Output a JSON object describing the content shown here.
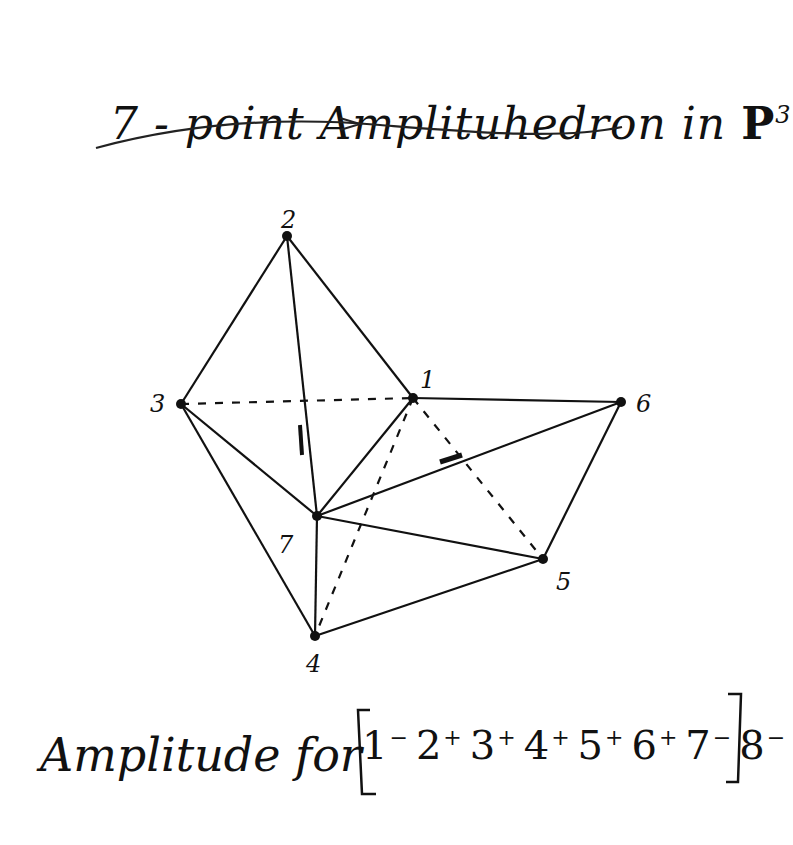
{
  "title": {
    "prefix": "7 - point Amplituhedron in ",
    "space": "P",
    "exponent": "3"
  },
  "diagram": {
    "vertices": [
      {
        "id": "1",
        "label": "1",
        "x": 413,
        "y": 398,
        "lx": 420,
        "ly": 388
      },
      {
        "id": "2",
        "label": "2",
        "x": 287,
        "y": 236,
        "lx": 281,
        "ly": 228
      },
      {
        "id": "3",
        "label": "3",
        "x": 181,
        "y": 404,
        "lx": 150,
        "ly": 412
      },
      {
        "id": "4",
        "label": "4",
        "x": 315,
        "y": 636,
        "lx": 306,
        "ly": 672
      },
      {
        "id": "5",
        "label": "5",
        "x": 543,
        "y": 559,
        "lx": 556,
        "ly": 590
      },
      {
        "id": "6",
        "label": "6",
        "x": 621,
        "y": 402,
        "lx": 636,
        "ly": 412
      },
      {
        "id": "7",
        "label": "7",
        "x": 317,
        "y": 516,
        "lx": 278,
        "ly": 553
      }
    ],
    "edges": [
      {
        "from": "2",
        "to": "3",
        "style": "solid"
      },
      {
        "from": "2",
        "to": "1",
        "style": "solid"
      },
      {
        "from": "2",
        "to": "7",
        "style": "solid"
      },
      {
        "from": "3",
        "to": "1",
        "style": "dashed"
      },
      {
        "from": "3",
        "to": "7",
        "style": "solid"
      },
      {
        "from": "3",
        "to": "4",
        "style": "solid"
      },
      {
        "from": "1",
        "to": "6",
        "style": "solid"
      },
      {
        "from": "1",
        "to": "7",
        "style": "solid"
      },
      {
        "from": "1",
        "to": "4",
        "style": "dashed"
      },
      {
        "from": "1",
        "to": "5",
        "style": "dashed"
      },
      {
        "from": "7",
        "to": "6",
        "style": "solid"
      },
      {
        "from": "7",
        "to": "5",
        "style": "solid"
      },
      {
        "from": "7",
        "to": "4",
        "style": "solid"
      },
      {
        "from": "6",
        "to": "5",
        "style": "solid"
      },
      {
        "from": "4",
        "to": "5",
        "style": "solid"
      }
    ],
    "stroke_color": "#111111"
  },
  "caption": {
    "text": "Amplitude for",
    "helicities": [
      {
        "particle": "1",
        "sign": "-"
      },
      {
        "particle": "2",
        "sign": "+"
      },
      {
        "particle": "3",
        "sign": "+"
      },
      {
        "particle": "4",
        "sign": "+"
      },
      {
        "particle": "5",
        "sign": "+"
      },
      {
        "particle": "6",
        "sign": "+"
      },
      {
        "particle": "7",
        "sign": "-"
      },
      {
        "particle": "8",
        "sign": "-"
      }
    ]
  }
}
